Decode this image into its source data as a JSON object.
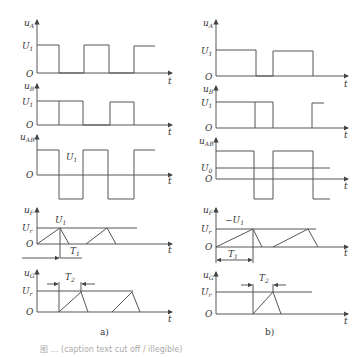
{
  "figure": {
    "panels": [
      {
        "id": "a",
        "label": "a)",
        "plots": [
          {
            "name": "uA",
            "ylabel": "u",
            "ylabel_sub": "A",
            "levels": [
              {
                "text": "U",
                "sub": "1"
              }
            ],
            "origin": "O",
            "xlabel": "t"
          },
          {
            "name": "uB",
            "ylabel": "u",
            "ylabel_sub": "B",
            "levels": [
              {
                "text": "U",
                "sub": "1"
              }
            ],
            "origin": "O",
            "xlabel": "t"
          },
          {
            "name": "uAB",
            "ylabel": "u",
            "ylabel_sub": "AB",
            "annotation": {
              "text": "U",
              "sub": "1"
            },
            "origin": "O",
            "xlabel": "t"
          },
          {
            "name": "uF",
            "ylabel": "u",
            "ylabel_sub": "F",
            "levels": [
              {
                "text": "U",
                "sub": "r"
              }
            ],
            "annotation": {
              "text": "U",
              "sub": "1"
            },
            "period": {
              "text": "T",
              "sub": "1"
            },
            "origin": "O",
            "xlabel": "t"
          },
          {
            "name": "uG",
            "ylabel": "u",
            "ylabel_sub": "G",
            "levels": [
              {
                "text": "U",
                "sub": "r"
              }
            ],
            "period": {
              "text": "T",
              "sub": "2"
            },
            "origin": "O",
            "xlabel": "t"
          }
        ]
      },
      {
        "id": "b",
        "label": "b)",
        "plots": [
          {
            "name": "uA",
            "ylabel": "u",
            "ylabel_sub": "A",
            "levels": [
              {
                "text": "U",
                "sub": "1"
              }
            ],
            "origin": "O",
            "xlabel": "t"
          },
          {
            "name": "uB",
            "ylabel": "u",
            "ylabel_sub": "B",
            "levels": [
              {
                "text": "U",
                "sub": "1"
              }
            ],
            "origin": "O",
            "xlabel": "t"
          },
          {
            "name": "uAB",
            "ylabel": "u",
            "ylabel_sub": "AB",
            "levels": [
              {
                "text": "U",
                "sub": "0"
              }
            ],
            "origin": "O",
            "xlabel": "t"
          },
          {
            "name": "uF",
            "ylabel": "u",
            "ylabel_sub": "F",
            "levels": [
              {
                "text": "U",
                "sub": "r"
              }
            ],
            "annotation": {
              "text": "−U",
              "sub": "1"
            },
            "period": {
              "text": "T",
              "sub": "1"
            },
            "origin": "O",
            "xlabel": "t"
          },
          {
            "name": "uG",
            "ylabel": "u",
            "ylabel_sub": "G",
            "levels": [
              {
                "text": "U",
                "sub": "r"
              }
            ],
            "period": {
              "text": "T",
              "sub": "2"
            },
            "origin": "O",
            "xlabel": "t"
          }
        ]
      }
    ],
    "caption": "图 …  (caption text cut off / illegible)"
  }
}
